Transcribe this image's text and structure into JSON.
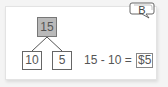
{
  "badge": {
    "label": "B"
  },
  "number_bond": {
    "whole": "15",
    "parts": [
      "10",
      "5"
    ]
  },
  "equation": {
    "expression": "15 - 10 =",
    "answer": "$5"
  },
  "colors": {
    "whole_fill": "#b9b9b9",
    "box_border": "#666666",
    "text": "#555555"
  }
}
